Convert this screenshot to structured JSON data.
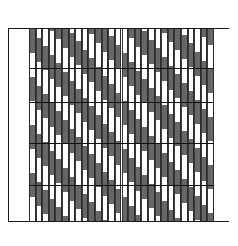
{
  "figure": {
    "type": "pattern-diagram",
    "title": ""
  },
  "frame": {
    "border_color": "#1a1a1a",
    "background": "#ffffff",
    "x": 8,
    "y": 8,
    "width": 221,
    "height": 230
  },
  "bands": {
    "top_label": "",
    "bottom_label": "",
    "top_height": 21,
    "bottom_height": 17
  },
  "chart_data": {
    "type": "heatmap",
    "title": "",
    "subtitle": "",
    "xlabel": "",
    "ylabel": "",
    "legend": [],
    "grid": true,
    "colors": {
      "dark": "#676767",
      "light": "#ffffff",
      "line": "#2b2b2b",
      "grid": "#111111"
    },
    "plot": {
      "x": 29,
      "y": 29,
      "width": 185,
      "height": 192
    },
    "column_count": 28,
    "column_width": 6.6,
    "gridlines_y": [
      39,
      73,
      114,
      156
    ],
    "note": "Each column is a stack of alternating dark/light segments whose offsets shift progressively, producing diagonal bands running from upper-left to lower-right.",
    "segment_height": 24,
    "diagonal_shift_per_column": 8.6,
    "series": [
      {
        "name": "column-0",
        "offset": 0
      },
      {
        "name": "column-1",
        "offset": 8.6
      },
      {
        "name": "column-2",
        "offset": 17.2
      },
      {
        "name": "column-3",
        "offset": 25.8
      },
      {
        "name": "column-4",
        "offset": 34.4
      },
      {
        "name": "column-5",
        "offset": 43.0
      },
      {
        "name": "column-6",
        "offset": 51.6
      },
      {
        "name": "column-7",
        "offset": 60.2
      },
      {
        "name": "column-8",
        "offset": 68.8
      },
      {
        "name": "column-9",
        "offset": 77.4
      },
      {
        "name": "column-10",
        "offset": 86.0
      },
      {
        "name": "column-11",
        "offset": 94.6
      },
      {
        "name": "column-12",
        "offset": 103.2
      },
      {
        "name": "column-13",
        "offset": 111.8
      },
      {
        "name": "column-14",
        "offset": 120.4
      },
      {
        "name": "column-15",
        "offset": 129.0
      },
      {
        "name": "column-16",
        "offset": 137.6
      },
      {
        "name": "column-17",
        "offset": 146.2
      },
      {
        "name": "column-18",
        "offset": 154.8
      },
      {
        "name": "column-19",
        "offset": 163.4
      },
      {
        "name": "column-20",
        "offset": 172.0
      },
      {
        "name": "column-21",
        "offset": 180.6
      },
      {
        "name": "column-22",
        "offset": 189.2
      },
      {
        "name": "column-23",
        "offset": 197.8
      },
      {
        "name": "column-24",
        "offset": 206.4
      },
      {
        "name": "column-25",
        "offset": 215.0
      },
      {
        "name": "column-26",
        "offset": 223.6
      },
      {
        "name": "column-27",
        "offset": 232.2
      }
    ]
  }
}
